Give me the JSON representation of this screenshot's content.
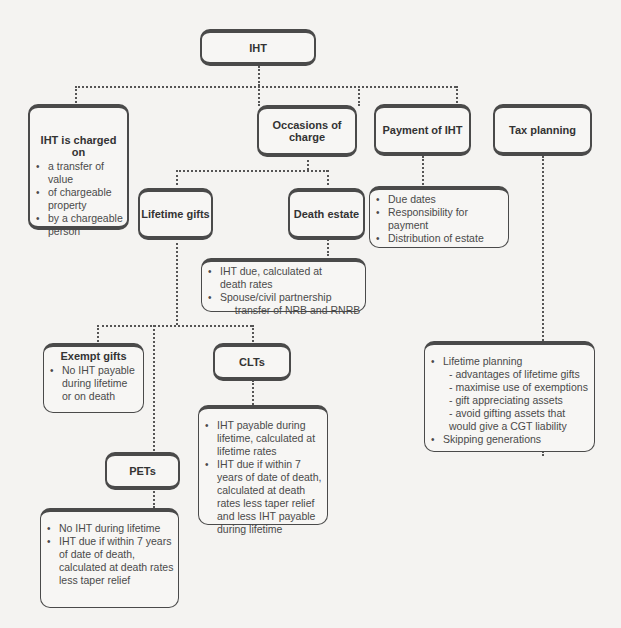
{
  "diagram": {
    "root": {
      "title": "IHT"
    },
    "charged_on": {
      "title": "IHT is charged on",
      "bullets": [
        "a transfer of value",
        "of chargeable property",
        "by a chargeable person"
      ]
    },
    "occasions": {
      "title": "Occasions of charge"
    },
    "payment": {
      "title": "Payment of IHT",
      "bullets": [
        "Due dates",
        "Responsibility for payment",
        "Distribution of estate"
      ]
    },
    "tax_planning": {
      "title": "Tax planning",
      "bullets": [
        {
          "text": "Lifetime planning",
          "subs": [
            "- advantages of lifetime gifts",
            "- maximise use of exemptions",
            "- gift appreciating assets",
            "- avoid gifting assets that would give a CGT liability"
          ]
        },
        {
          "text": "Skipping generations",
          "subs": []
        }
      ]
    },
    "lifetime_gifts": {
      "title": "Lifetime gifts"
    },
    "death_estate": {
      "title": "Death estate",
      "bullets": [
        "IHT due, calculated at death rates",
        "Spouse/civil partnership"
      ],
      "sub": "– transfer of NRB and RNRB"
    },
    "exempt_gifts": {
      "title": "Exempt gifts",
      "bullets": [
        "No IHT payable during lifetime or on death"
      ]
    },
    "clts": {
      "title": "CLTs",
      "bullets": [
        "IHT payable during lifetime, calculated at lifetime rates",
        "IHT due if within 7 years of date of death, calculated at death rates less taper relief and less IHT payable during lifetime"
      ]
    },
    "pets": {
      "title": "PETs",
      "bullets": [
        "No IHT during lifetime",
        "IHT due if within 7 years of date of death, calculated at death rates less taper relief"
      ]
    }
  }
}
